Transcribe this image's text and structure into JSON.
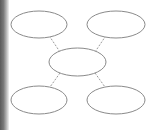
{
  "diagram": {
    "type": "hub-and-spoke",
    "stroke_color": "#8a8a8a",
    "connector_color": "#9a9a9a",
    "nodes": [
      {
        "id": "top-left",
        "cx": 39,
        "cy": 24.5,
        "rx": 28,
        "ry": 13.5,
        "label": ""
      },
      {
        "id": "top-right",
        "cx": 116,
        "cy": 24.5,
        "rx": 29,
        "ry": 13.5,
        "label": ""
      },
      {
        "id": "center",
        "cx": 77.5,
        "cy": 62,
        "rx": 28.5,
        "ry": 14,
        "label": ""
      },
      {
        "id": "bottom-left",
        "cx": 39,
        "cy": 100,
        "rx": 28,
        "ry": 14,
        "label": ""
      },
      {
        "id": "bottom-right",
        "cx": 116,
        "cy": 100,
        "rx": 29,
        "ry": 14,
        "label": ""
      }
    ],
    "connectors": [
      {
        "from": "center",
        "to": "top-left",
        "x1": 60,
        "y1": 52,
        "x2": 50,
        "y2": 37,
        "style": "dashed"
      },
      {
        "from": "center",
        "to": "top-right",
        "x1": 95,
        "y1": 52,
        "x2": 105,
        "y2": 37,
        "style": "dashed"
      },
      {
        "from": "center",
        "to": "bottom-left",
        "x1": 60,
        "y1": 73,
        "x2": 50,
        "y2": 87,
        "style": "dashed"
      },
      {
        "from": "center",
        "to": "bottom-right",
        "x1": 95,
        "y1": 73,
        "x2": 105,
        "y2": 87,
        "style": "dashed"
      }
    ]
  }
}
